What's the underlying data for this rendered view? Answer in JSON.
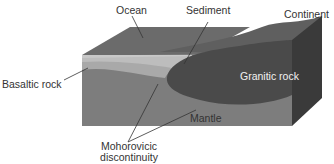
{
  "diagram": {
    "labels": {
      "ocean": "Ocean",
      "sediment": "Sediment",
      "continent": "Continent",
      "basaltic_rock": "Basaltic rock",
      "granitic_rock": "Granitic rock",
      "mantle": "Mantle",
      "moho_line1": "Mohorovicic",
      "moho_line2": "discontinuity"
    },
    "colors": {
      "ocean_top": "#6b6b6b",
      "ocean_front": "#7a7a7a",
      "water_edge": "#c8c8c8",
      "basalt": "#a9a9a9",
      "granite": "#4a4a4a",
      "mantle": "#7d7d7d",
      "continent_top": "#5f5f5f",
      "side_face": "#3a3a3a",
      "leader": "#333333"
    }
  }
}
